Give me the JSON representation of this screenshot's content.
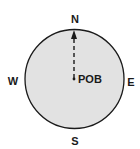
{
  "diagram": {
    "type": "compass",
    "labels": {
      "north": "N",
      "south": "S",
      "east": "E",
      "west": "W",
      "center": "POB"
    },
    "arrow": {
      "direction": "north",
      "style": "dashed"
    },
    "colors": {
      "circle_fill": "#e2e2e2",
      "circle_stroke": "#1a1a1a",
      "text": "#1a1a1a",
      "background": "#ffffff"
    }
  }
}
